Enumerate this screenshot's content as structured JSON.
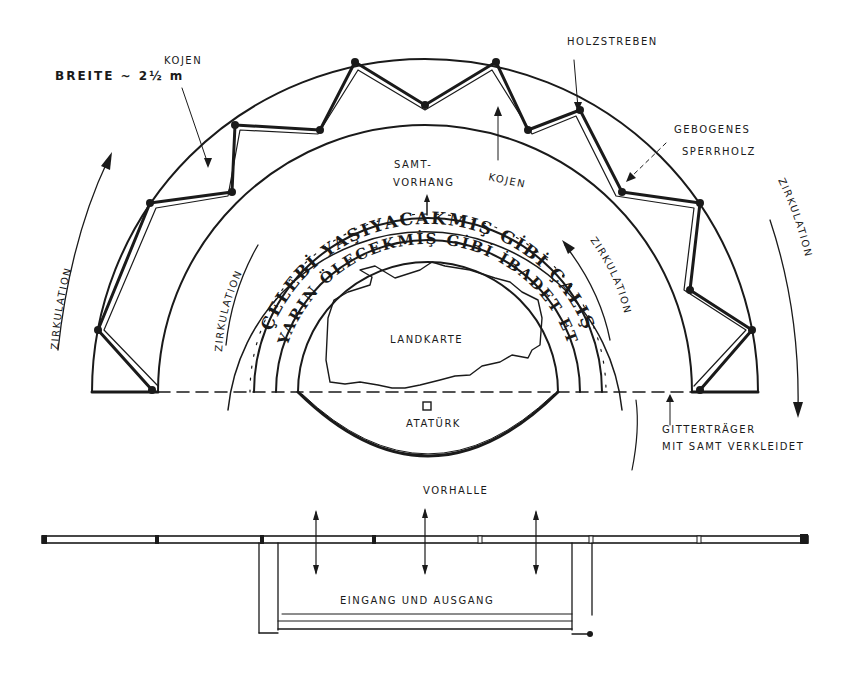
{
  "diagram": {
    "type": "architectural-floor-plan",
    "colors": {
      "ink": "#1a1a1a",
      "paper": "#ffffff"
    }
  },
  "labels": {
    "width_note": "BREITE ~ 2½ m",
    "booths_left": "KOJEN",
    "booths_center": "KOJEN",
    "timber_struts": "HOLZSTREBEN",
    "bent_plywood_line1": "GEBOGENES",
    "bent_plywood_line2": "SPERRHOLZ",
    "velvet_curtain_line1": "SAMT-",
    "velvet_curtain_line2": "VORHANG",
    "circulation_outer_left": "ZIRKULATION",
    "circulation_inner_left": "ZIRKULATION",
    "circulation_inner_right": "ZIRKULATION",
    "circulation_outer_right": "ZIRKULATION",
    "map": "LANDKARTE",
    "statue": "ATATÜRK",
    "truss_line1": "GITTERTRÄGER",
    "truss_line2": "MIT SAMT VERKLEIDET",
    "foyer": "VORHALLE",
    "entrance_exit": "EINGANG UND AUSGANG"
  },
  "inscription": {
    "outer_ring": "ÇELEBİ YAŞIYACAKMIŞ GİBİ ÇALIŞ",
    "inner_ring": "YARIN ÖLECEKMİŞ GİBİ İBADET ET"
  }
}
